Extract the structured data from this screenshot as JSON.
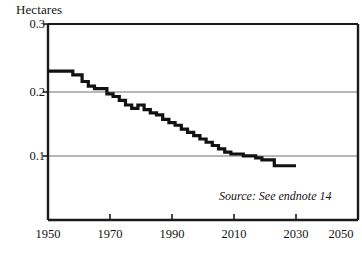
{
  "chart_data": {
    "type": "line",
    "title": "",
    "ylabel": "Hectares",
    "xlabel": "",
    "xlim": [
      1950,
      2050
    ],
    "ylim": [
      0,
      0.3
    ],
    "y_ticks": [
      0.1,
      0.2,
      0.3
    ],
    "y_tick_labels": [
      "0.1",
      "0.2",
      "0.3"
    ],
    "x_ticks": [
      1950,
      1970,
      1990,
      2010,
      2030,
      2050
    ],
    "x_tick_labels": [
      "1950",
      "1970",
      "1990",
      "2010",
      "2030",
      "2050"
    ],
    "grid": "horizontal",
    "legend": "none",
    "line_style": "step",
    "line_color": "#111111",
    "annotations": [
      "Source: See endnote 14"
    ],
    "series": [
      {
        "name": "Grainland per person",
        "x": [
          1950,
          1955,
          1958,
          1961,
          1963,
          1965,
          1967,
          1969,
          1971,
          1973,
          1975,
          1977,
          1979,
          1981,
          1983,
          1985,
          1987,
          1989,
          1991,
          1993,
          1995,
          1997,
          1999,
          2001,
          2003,
          2005,
          2007,
          2009,
          2011,
          2013,
          2015,
          2017,
          2019,
          2021,
          2023,
          2025,
          2030
        ],
        "values": [
          0.228,
          0.228,
          0.222,
          0.212,
          0.205,
          0.201,
          0.201,
          0.193,
          0.189,
          0.183,
          0.176,
          0.171,
          0.176,
          0.169,
          0.164,
          0.161,
          0.154,
          0.149,
          0.145,
          0.139,
          0.134,
          0.129,
          0.124,
          0.119,
          0.114,
          0.109,
          0.104,
          0.101,
          0.101,
          0.098,
          0.098,
          0.095,
          0.092,
          0.092,
          0.083,
          0.083,
          0.083
        ]
      }
    ]
  },
  "axis": {
    "y_title": "Hectares",
    "y_labels": [
      "0.3",
      "0.2",
      "0.1"
    ],
    "x_labels": [
      "1950",
      "1970",
      "1990",
      "2010",
      "2030",
      "2050"
    ]
  },
  "source": {
    "text": "Source: See endnote 14"
  }
}
